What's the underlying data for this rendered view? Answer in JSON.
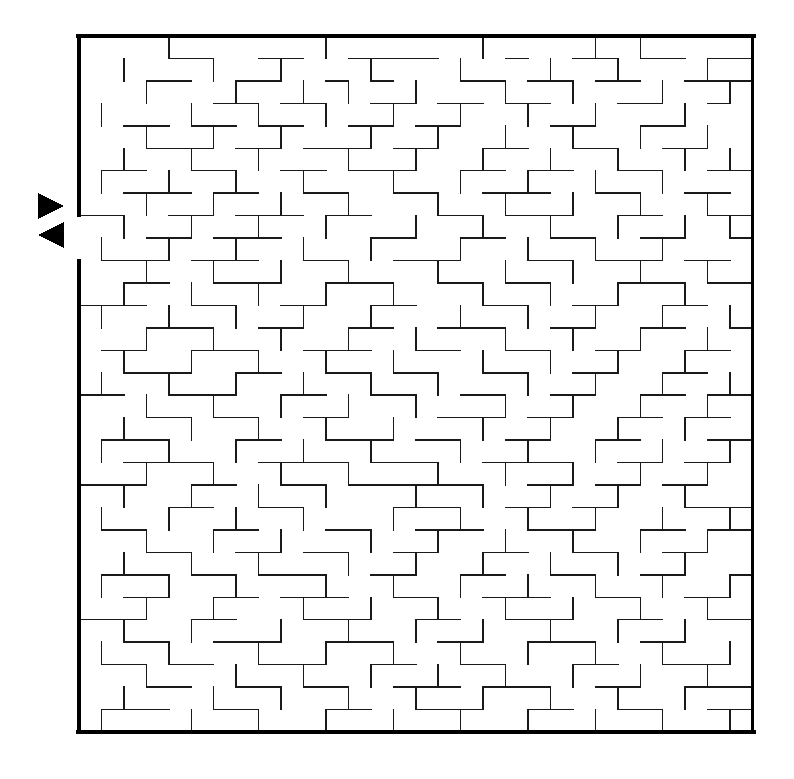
{
  "page": {
    "background_color": "#ffffff",
    "width": 794,
    "height": 779
  },
  "maze": {
    "name": "rectangular-grid-maze",
    "cols": 30,
    "rows": 31,
    "origin_x": 79,
    "origin_y": 36,
    "cell_size": 22.45,
    "wall_color": "#1a1a1a",
    "border_color": "#000000",
    "border_thickness": 3.2,
    "wall_thickness": 1.5,
    "entrance": {
      "side": "left",
      "row": 8,
      "label": "entrance"
    },
    "exit": {
      "side": "left",
      "row": 9,
      "label": "exit"
    },
    "markers": [
      {
        "name": "entrance-arrow-right",
        "shape": "triangle",
        "direction": "right",
        "x": 38,
        "y": 193,
        "size": 26,
        "color": "#000000"
      },
      {
        "name": "exit-arrow-left",
        "shape": "triangle",
        "direction": "left",
        "x": 38,
        "y": 222,
        "size": 26,
        "color": "#000000"
      }
    ],
    "border_gaps": {
      "left": [
        8,
        9
      ]
    },
    "h_walls": [
      "1:4-6",
      "1:8-10",
      "1:12-16",
      "1:19-20",
      "1:22-24",
      "1:25-27",
      "1:28-30",
      "2:3-5",
      "2:7-9",
      "2:11-12",
      "2:13-14",
      "2:17-19",
      "2:20-22",
      "2:23-25",
      "2:27-30",
      "3:6-8",
      "3:9-11",
      "3:13-15",
      "3:16-18",
      "3:19-21",
      "3:24-26",
      "3:28-29",
      "4:2-4",
      "4:5-7",
      "4:8-10",
      "4:12-14",
      "4:15-17",
      "4:21-23",
      "4:25-27",
      "5:3-6",
      "5:7-9",
      "5:10-13",
      "5:14-16",
      "5:18-20",
      "5:22-24",
      "5:26-28",
      "6:1-3",
      "6:5-7",
      "6:9-11",
      "6:12-15",
      "6:17-19",
      "6:20-22",
      "6:24-26",
      "6:28-30",
      "7:2-5",
      "7:6-8",
      "7:10-12",
      "7:14-16",
      "7:18-21",
      "7:23-25",
      "7:27-29",
      "8:0-2",
      "8:4-6",
      "8:7-10",
      "8:11-13",
      "8:16-18",
      "8:19-22",
      "8:24-26",
      "8:28-30",
      "9:3-5",
      "9:6-9",
      "9:13-15",
      "9:17-19",
      "9:21-23",
      "9:25-27",
      "9:29-30",
      "10:1-4",
      "10:5-8",
      "10:10-12",
      "10:14-17",
      "10:20-22",
      "10:23-26",
      "10:27-29",
      "11:2-4",
      "11:6-9",
      "11:11-14",
      "11:16-18",
      "11:19-21",
      "11:24-27",
      "11:28-30",
      "12:0-3",
      "12:5-7",
      "12:9-11",
      "12:13-15",
      "12:18-20",
      "12:22-24",
      "12:26-28",
      "13:3-6",
      "13:8-10",
      "13:12-14",
      "13:16-19",
      "13:21-23",
      "13:25-27",
      "13:29-30",
      "14:1-3",
      "14:5-8",
      "14:10-13",
      "14:15-17",
      "14:19-21",
      "14:23-25",
      "14:27-29",
      "15:2-5",
      "15:7-9",
      "15:11-13",
      "15:14-16",
      "15:18-20",
      "15:22-24",
      "15:26-28",
      "16:0-2",
      "16:4-7",
      "16:9-11",
      "16:13-15",
      "16:17-19",
      "16:21-23",
      "16:25-27",
      "16:28-30",
      "17:3-5",
      "17:6-8",
      "17:10-12",
      "17:16-19",
      "17:20-22",
      "17:24-26",
      "17:27-29",
      "18:1-4",
      "18:7-9",
      "18:11-14",
      "18:15-17",
      "18:19-21",
      "18:23-25",
      "18:28-30",
      "19:2-6",
      "19:8-12",
      "19:13-16",
      "19:18-22",
      "19:24-26",
      "19:27-29",
      "20:0-3",
      "20:5-7",
      "20:9-11",
      "20:12-18",
      "20:20-22",
      "20:23-25",
      "20:26-28",
      "21:4-6",
      "21:8-10",
      "21:14-17",
      "21:19-21",
      "21:22-24",
      "21:27-30",
      "22:1-3",
      "22:6-8",
      "22:11-13",
      "22:15-18",
      "22:20-23",
      "22:25-27",
      "22:28-30",
      "23:3-5",
      "23:7-9",
      "23:10-12",
      "23:14-16",
      "23:18-20",
      "23:22-24",
      "23:26-28",
      "24:1-4",
      "24:5-7",
      "24:8-11",
      "24:13-15",
      "24:17-19",
      "24:21-23",
      "24:25-27",
      "24:29-30",
      "25:2-4",
      "25:6-8",
      "25:9-12",
      "25:14-16",
      "25:18-21",
      "25:23-25",
      "25:27-29",
      "26:0-3",
      "26:5-7",
      "26:10-13",
      "26:15-17",
      "26:19-22",
      "26:24-26",
      "26:28-30",
      "27:2-4",
      "27:6-9",
      "27:11-14",
      "27:16-18",
      "27:20-23",
      "27:25-27",
      "28:1-3",
      "28:4-6",
      "28:8-11",
      "28:13-15",
      "28:17-19",
      "28:22-24",
      "28:26-29",
      "29:3-5",
      "29:7-9",
      "29:10-12",
      "29:14-17",
      "29:18-21",
      "29:23-25",
      "29:27-30",
      "30:1-4",
      "30:6-8",
      "30:11-13",
      "30:15-18",
      "30:20-22",
      "30:24-26",
      "30:28-30"
    ],
    "v_walls": [
      "0:4",
      "0:11",
      "0:18",
      "0:23",
      "0:25",
      "1:2",
      "1:6",
      "1:9",
      "1:13",
      "1:17",
      "1:21",
      "1:24",
      "1:28",
      "2:3",
      "2:7",
      "2:10",
      "2:12",
      "2:15",
      "2:19",
      "2:22",
      "2:26",
      "2:29",
      "3:1",
      "3:5",
      "3:8",
      "3:11",
      "3:14",
      "3:17",
      "3:20",
      "3:23",
      "3:27",
      "4:3",
      "4:6",
      "4:9",
      "4:13",
      "4:16",
      "4:19",
      "4:22",
      "4:25",
      "4:28",
      "5:2",
      "5:5",
      "5:8",
      "5:12",
      "5:15",
      "5:18",
      "5:21",
      "5:24",
      "5:27",
      "5:29",
      "6:1",
      "6:4",
      "6:7",
      "6:10",
      "6:14",
      "6:17",
      "6:20",
      "6:23",
      "6:26",
      "7:3",
      "7:6",
      "7:9",
      "7:12",
      "7:16",
      "7:19",
      "7:22",
      "7:25",
      "7:28",
      "8:2",
      "8:5",
      "8:8",
      "8:11",
      "8:15",
      "8:18",
      "8:21",
      "8:24",
      "8:27",
      "8:29",
      "9:1",
      "9:4",
      "9:7",
      "9:10",
      "9:13",
      "9:17",
      "9:20",
      "9:23",
      "9:26",
      "10:3",
      "10:6",
      "10:9",
      "10:12",
      "10:16",
      "10:19",
      "10:22",
      "10:25",
      "10:28",
      "11:2",
      "11:5",
      "11:8",
      "11:11",
      "11:14",
      "11:18",
      "11:21",
      "11:24",
      "11:27",
      "12:1",
      "12:4",
      "12:7",
      "12:10",
      "12:13",
      "12:17",
      "12:20",
      "12:23",
      "12:26",
      "12:29",
      "13:3",
      "13:6",
      "13:9",
      "13:12",
      "13:15",
      "13:19",
      "13:22",
      "13:25",
      "13:28",
      "14:2",
      "14:5",
      "14:8",
      "14:11",
      "14:14",
      "14:18",
      "14:21",
      "14:24",
      "14:27",
      "15:1",
      "15:4",
      "15:7",
      "15:10",
      "15:13",
      "15:16",
      "15:20",
      "15:23",
      "15:26",
      "15:29",
      "16:3",
      "16:6",
      "16:9",
      "16:12",
      "16:15",
      "16:19",
      "16:22",
      "16:25",
      "16:28",
      "17:2",
      "17:5",
      "17:8",
      "17:11",
      "17:14",
      "17:18",
      "17:21",
      "17:24",
      "17:27",
      "18:1",
      "18:4",
      "18:7",
      "18:10",
      "18:13",
      "18:17",
      "18:20",
      "18:23",
      "18:26",
      "18:29",
      "19:3",
      "19:6",
      "19:9",
      "19:12",
      "19:16",
      "19:19",
      "19:22",
      "19:25",
      "19:28",
      "20:2",
      "20:5",
      "20:8",
      "20:11",
      "20:15",
      "20:18",
      "20:21",
      "20:24",
      "20:27",
      "21:1",
      "21:4",
      "21:7",
      "21:10",
      "21:14",
      "21:17",
      "21:20",
      "21:23",
      "21:26",
      "21:29",
      "22:3",
      "22:6",
      "22:9",
      "22:13",
      "22:16",
      "22:19",
      "22:22",
      "22:25",
      "22:28",
      "23:2",
      "23:5",
      "23:8",
      "23:12",
      "23:15",
      "23:18",
      "23:21",
      "23:24",
      "23:27",
      "24:1",
      "24:4",
      "24:7",
      "24:11",
      "24:14",
      "24:17",
      "24:20",
      "24:23",
      "24:26",
      "24:29",
      "25:3",
      "25:6",
      "25:10",
      "25:13",
      "25:16",
      "25:19",
      "25:22",
      "25:25",
      "25:28",
      "26:2",
      "26:5",
      "26:9",
      "26:12",
      "26:15",
      "26:18",
      "26:21",
      "26:24",
      "26:27",
      "27:1",
      "27:4",
      "27:8",
      "27:11",
      "27:14",
      "27:17",
      "27:20",
      "27:23",
      "27:26",
      "27:29",
      "28:3",
      "28:7",
      "28:10",
      "28:13",
      "28:16",
      "28:19",
      "28:22",
      "28:25",
      "28:28",
      "29:2",
      "29:6",
      "29:9",
      "29:12",
      "29:15",
      "29:18",
      "29:21",
      "29:24",
      "29:27",
      "30:1",
      "30:5",
      "30:8",
      "30:11",
      "30:14",
      "30:17",
      "30:20",
      "30:23",
      "30:26",
      "30:29"
    ]
  }
}
